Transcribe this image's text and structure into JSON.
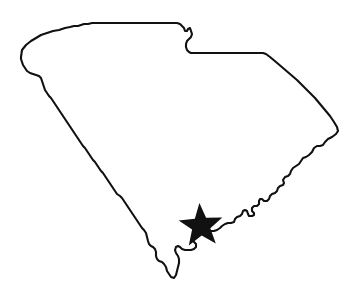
{
  "figure": {
    "kind": "state-outline-map",
    "width": 357,
    "height": 303,
    "background_color": "#ffffff"
  },
  "map": {
    "region_name": "South Carolina",
    "outline": {
      "name": "south-carolina-boundary",
      "stroke_color": "#111111",
      "fill_color": "none",
      "stroke_width": 2.1,
      "style": "thin hand-traced pixelated black outline, unfilled interior"
    },
    "extent_px": {
      "west_point": [
        21,
        57
      ],
      "north_edge_y": 23,
      "east_point": [
        338,
        132
      ],
      "south_point": [
        176,
        278
      ]
    },
    "borders": [
      {
        "name": "north-border-north-carolina",
        "description": "near-horizontal northern boundary with North Carolina running east from the northwest tip, with a stepped drop at the northeast"
      },
      {
        "name": "northeast-step-notch",
        "description": "stair-step notch where the border drops south then runs flat east"
      },
      {
        "name": "east-border-north-carolina-diagonal",
        "description": "long straight diagonal running southeast to the easternmost point"
      },
      {
        "name": "southeast-atlantic-coastline",
        "description": "jagged Atlantic coastline with small inlets and bays running southwest"
      },
      {
        "name": "southwest-savannah-river-border-georgia",
        "description": "long jagged diagonal Savannah River border with Georgia running northwest"
      }
    ]
  },
  "marker": {
    "name": "capital-city-star-marker",
    "shape": "five-pointed-star",
    "fill_color": "#111111",
    "center_px": [
      201,
      226
    ],
    "outer_radius_px": 23,
    "inner_radius_px": 9.6,
    "rotation_deg": -4
  },
  "labels": {
    "visible_text": []
  }
}
